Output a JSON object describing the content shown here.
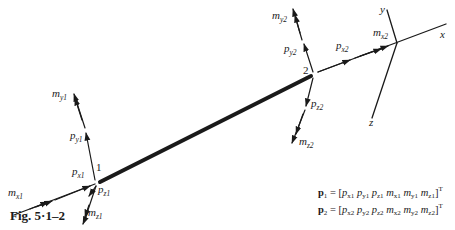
{
  "figure": {
    "caption": "Fig. 5·1–2",
    "nodes": [
      {
        "id": "1",
        "label": "1"
      },
      {
        "id": "2",
        "label": "2"
      }
    ],
    "axes": {
      "x": "x",
      "y": "y",
      "z": "z"
    },
    "node1_labels": {
      "mx": {
        "base": "m",
        "sub": "x1"
      },
      "px": {
        "base": "p",
        "sub": "x1"
      },
      "py": {
        "base": "p",
        "sub": "y1"
      },
      "my": {
        "base": "m",
        "sub": "y1"
      },
      "pz": {
        "base": "p",
        "sub": "z1"
      },
      "mz": {
        "base": "m",
        "sub": "z1"
      }
    },
    "node2_labels": {
      "px": {
        "base": "p",
        "sub": "x2"
      },
      "mx": {
        "base": "m",
        "sub": "x2"
      },
      "py": {
        "base": "p",
        "sub": "y2"
      },
      "my": {
        "base": "m",
        "sub": "y2"
      },
      "pz": {
        "base": "p",
        "sub": "z2"
      },
      "mz": {
        "base": "m",
        "sub": "z2"
      }
    },
    "equations": [
      {
        "lhs": "p",
        "lhs_sub": "1",
        "terms": [
          "p|x1",
          "p|y1",
          "p|z1",
          "m|x1",
          "m|y1",
          "m|z1"
        ],
        "sup": "T"
      },
      {
        "lhs": "p",
        "lhs_sub": "2",
        "terms": [
          "p|x2",
          "p|y2",
          "p|z2",
          "m|x2",
          "m|y2",
          "m|z2"
        ],
        "sup": "T"
      }
    ],
    "colors": {
      "ink": "#1a1a1a",
      "background": "#ffffff"
    }
  }
}
